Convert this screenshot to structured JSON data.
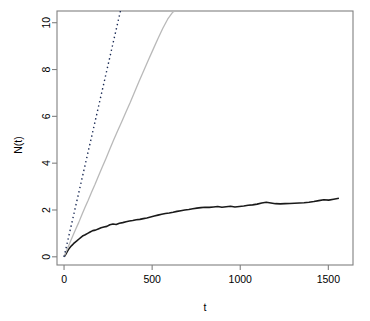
{
  "chart_data": {
    "type": "line",
    "title": "",
    "xlabel": "t",
    "ylabel": "N(t)",
    "xlim": [
      -40,
      1640
    ],
    "ylim": [
      -0.35,
      10.5
    ],
    "xticks": [
      0,
      500,
      1000,
      1500
    ],
    "yticks": [
      0,
      2,
      4,
      6,
      8,
      10
    ],
    "xtick_labels": [
      "0",
      "500",
      "1000",
      "1500"
    ],
    "ytick_labels": [
      "0",
      "2",
      "4",
      "6",
      "8",
      "10"
    ],
    "grid": false,
    "legend": "none",
    "box": true,
    "colors": {
      "series_black": "#1a1a1a",
      "series_gray": "#b9b9b9",
      "series_dotted": "#1a2a55",
      "axis": "#808080",
      "text": "#000000",
      "background": "#ffffff"
    },
    "series": [
      {
        "name": "empirical-counting-process",
        "style": "solid",
        "color": "#1a1a1a",
        "width": 1.6,
        "x": [
          0,
          6,
          12,
          18,
          24,
          30,
          38,
          46,
          55,
          64,
          74,
          85,
          96,
          108,
          120,
          134,
          148,
          163,
          178,
          194,
          210,
          226,
          243,
          260,
          278,
          296,
          314,
          333,
          352,
          371,
          390,
          410,
          430,
          450,
          470,
          491,
          512,
          533,
          554,
          575,
          597,
          619,
          641,
          663,
          685,
          708,
          731,
          754,
          777,
          800,
          824,
          848,
          872,
          896,
          920,
          945,
          970,
          995,
          1020,
          1045,
          1070,
          1096,
          1122,
          1148,
          1174,
          1200,
          1227,
          1254,
          1281,
          1308,
          1335,
          1362,
          1390,
          1418,
          1446,
          1474,
          1502,
          1530,
          1560
        ],
        "y": [
          0.0,
          0.06,
          0.14,
          0.22,
          0.3,
          0.36,
          0.44,
          0.5,
          0.57,
          0.63,
          0.69,
          0.76,
          0.83,
          0.9,
          0.94,
          1.0,
          1.06,
          1.12,
          1.14,
          1.19,
          1.24,
          1.27,
          1.3,
          1.37,
          1.4,
          1.38,
          1.43,
          1.46,
          1.5,
          1.53,
          1.55,
          1.58,
          1.6,
          1.63,
          1.66,
          1.7,
          1.74,
          1.78,
          1.82,
          1.85,
          1.87,
          1.9,
          1.94,
          1.97,
          2.0,
          2.02,
          2.05,
          2.08,
          2.1,
          2.12,
          2.11,
          2.13,
          2.15,
          2.12,
          2.14,
          2.16,
          2.13,
          2.15,
          2.17,
          2.2,
          2.22,
          2.25,
          2.3,
          2.33,
          2.3,
          2.27,
          2.26,
          2.27,
          2.28,
          2.29,
          2.3,
          2.31,
          2.33,
          2.36,
          2.4,
          2.44,
          2.42,
          2.46,
          2.5
        ]
      },
      {
        "name": "gray-comparison-process",
        "style": "solid",
        "color": "#b9b9b9",
        "width": 1.3,
        "x": [
          0,
          10,
          22,
          35,
          50,
          66,
          83,
          100,
          118,
          137,
          156,
          176,
          196,
          217,
          238,
          260,
          282,
          305,
          328,
          352,
          376,
          401,
          426,
          452,
          478,
          505,
          532,
          560,
          588,
          617,
          630
        ],
        "y": [
          0.0,
          0.18,
          0.4,
          0.63,
          0.9,
          1.18,
          1.46,
          1.78,
          2.1,
          2.42,
          2.76,
          3.1,
          3.46,
          3.84,
          4.2,
          4.6,
          5.0,
          5.4,
          5.78,
          6.2,
          6.6,
          7.05,
          7.5,
          7.95,
          8.4,
          8.85,
          9.3,
          9.75,
          10.15,
          10.45,
          10.5
        ]
      },
      {
        "name": "theoretical-mean-function",
        "style": "dotted",
        "color": "#1a2a55",
        "width": 1.4,
        "x": [
          0,
          320
        ],
        "y": [
          0.0,
          10.5
        ]
      }
    ]
  }
}
